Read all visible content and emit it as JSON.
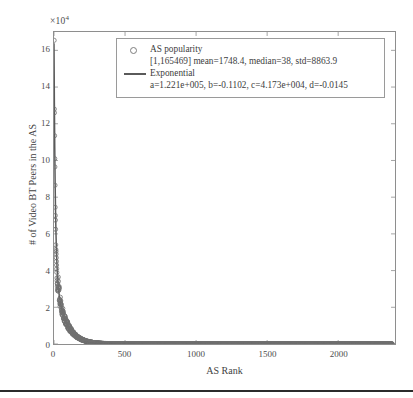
{
  "chart_data": {
    "type": "scatter",
    "title": "",
    "xlabel": "AS Rank",
    "ylabel": "# of Video BT Peers in the AS",
    "y_exponent_label": "×10",
    "y_exponent_power": "4",
    "y_multiplier": 10000,
    "xlim": [
      0,
      2400
    ],
    "ylim": [
      0,
      170000
    ],
    "xticks": [
      0,
      500,
      1000,
      1500,
      2000
    ],
    "xticklabels": [
      "0",
      "500",
      "1000",
      "1500",
      "2000"
    ],
    "yticks": [
      0,
      2,
      4,
      6,
      8,
      10,
      12,
      14,
      16
    ],
    "yticklabels": [
      "0",
      "2",
      "4",
      "6",
      "8",
      "10",
      "12",
      "14",
      "16"
    ],
    "grid": false,
    "legend_position": "top-center",
    "n_points": 2380,
    "series": [
      {
        "name": "AS popularity",
        "type": "scatter",
        "marker": "circle-open",
        "color": "#6f6f6f",
        "stats": {
          "range_min": 1,
          "range_max": 165469,
          "mean": 1748.4,
          "median": 38,
          "std": 8863.9
        },
        "head_values": [
          165469,
          128000,
          126000,
          113500,
          101000,
          96500,
          86500,
          74500,
          70000,
          67500,
          62500,
          54000,
          51500,
          50500,
          49000,
          47000,
          45000,
          43000,
          41000,
          39000,
          36000,
          34500,
          33000,
          31500,
          30000
        ]
      },
      {
        "name": "Exponential",
        "type": "line",
        "color": "#595959",
        "equation": "a*exp(b*x) + c*exp(d*x)",
        "params": {
          "a": 122100,
          "a_text": "1.221e+005",
          "b": -0.1102,
          "c": 41730,
          "c_text": "4.173e+004",
          "d": -0.0145
        }
      }
    ]
  },
  "legend": {
    "entries": [
      {
        "marker": "circle-open",
        "label": "AS popularity",
        "detail": "[1,165469] mean=1748.4, median=38, std=8863.9"
      },
      {
        "marker": "line",
        "label": "Exponential",
        "detail": "a=1.221e+005, b=-0.1102, c=4.173e+004, d=-0.0145"
      }
    ]
  },
  "colors": {
    "marker": "#6f6f6f",
    "fit_line": "#595959",
    "axis": "#8e8e8e",
    "text": "#3d3d3d",
    "background": "#ffffff",
    "page_rule": "#2b2b2b"
  }
}
